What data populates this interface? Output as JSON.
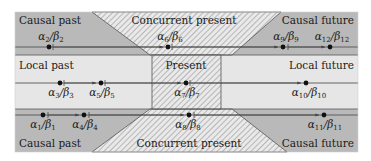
{
  "diagram": {
    "colors": {
      "causal_fill": "#b9b9b9",
      "local_fill": "#e6e6e6",
      "hatch_bg": "#e9e9e9",
      "hatch_line": "#9a9a9a",
      "stroke": "#555555",
      "dot": "#111111"
    },
    "regions": {
      "top_left": "Causal past",
      "top_center": "Concurrent present",
      "top_right": "Causal future",
      "mid_left": "Local past",
      "mid_center": "Present",
      "mid_right": "Local future",
      "bottom_left": "Causal past",
      "bottom_center": "Concurrent present",
      "bottom_right": "Causal future"
    },
    "events": [
      {
        "id": "e1",
        "alpha": "α",
        "beta": "β",
        "index": "1",
        "row": "bottom"
      },
      {
        "id": "e2",
        "alpha": "α",
        "beta": "β",
        "index": "2",
        "row": "top"
      },
      {
        "id": "e3",
        "alpha": "α",
        "beta": "β",
        "index": "3",
        "row": "middle"
      },
      {
        "id": "e4",
        "alpha": "α",
        "beta": "β",
        "index": "4",
        "row": "bottom"
      },
      {
        "id": "e5",
        "alpha": "α",
        "beta": "β",
        "index": "5",
        "row": "middle"
      },
      {
        "id": "e6",
        "alpha": "α",
        "beta": "β",
        "index": "6",
        "row": "top"
      },
      {
        "id": "e7",
        "alpha": "α",
        "beta": "β",
        "index": "7",
        "row": "middle"
      },
      {
        "id": "e8",
        "alpha": "α",
        "beta": "β",
        "index": "8",
        "row": "bottom"
      },
      {
        "id": "e9",
        "alpha": "α",
        "beta": "β",
        "index": "9",
        "row": "top"
      },
      {
        "id": "e10",
        "alpha": "α",
        "beta": "β",
        "index": "10",
        "row": "middle"
      },
      {
        "id": "e11",
        "alpha": "α",
        "beta": "β",
        "index": "11",
        "row": "bottom"
      },
      {
        "id": "e12",
        "alpha": "α",
        "beta": "β",
        "index": "12",
        "row": "top"
      }
    ],
    "slash": "/"
  }
}
